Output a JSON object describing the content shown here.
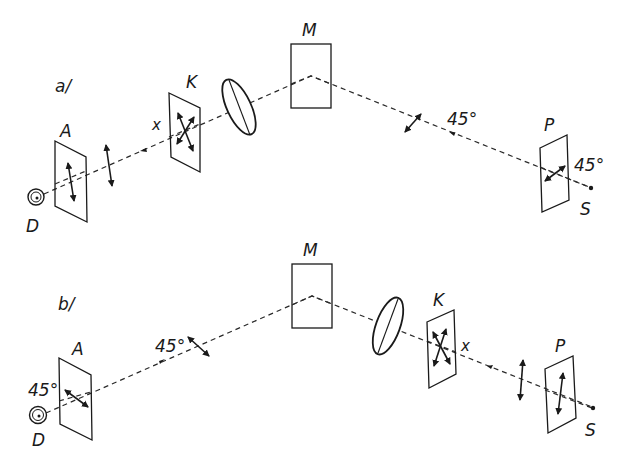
{
  "figure": {
    "panels": [
      {
        "id": "a",
        "label": "a/",
        "detector_label": "D",
        "analyzer_label": "A",
        "compensator_label": "K",
        "compensator_axis_label": "x",
        "mirror_label": "M",
        "polarizer_label": "P",
        "source_label": "S",
        "angle_after_mirror": "45°",
        "angle_polarizer": "45°"
      },
      {
        "id": "b",
        "label": "b/",
        "detector_label": "D",
        "analyzer_label": "A",
        "analyzer_angle": "45°",
        "angle_before_mirror": "45°",
        "mirror_label": "M",
        "compensator_label": "K",
        "compensator_axis_label": "x",
        "polarizer_label": "P",
        "source_label": "S"
      }
    ],
    "colors": {
      "ink": "#1a1a1a",
      "background": "#ffffff"
    }
  }
}
